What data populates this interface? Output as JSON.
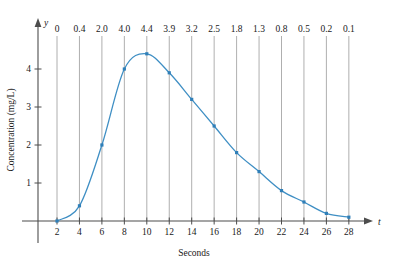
{
  "chart_data": {
    "type": "line",
    "title": "",
    "xlabel": "Seconds",
    "ylabel": "Concentration (mg/L)",
    "x_axis_name": "t",
    "y_axis_name": "y",
    "x": [
      2,
      4,
      6,
      8,
      10,
      12,
      14,
      16,
      18,
      20,
      22,
      24,
      26,
      28
    ],
    "values": [
      0,
      0.4,
      2.0,
      4.0,
      4.4,
      3.9,
      3.2,
      2.5,
      1.8,
      1.3,
      0.8,
      0.5,
      0.2,
      0.1
    ],
    "point_labels": [
      "0",
      "0.4",
      "2.0",
      "4.0",
      "4.4",
      "3.9",
      "3.2",
      "2.5",
      "1.8",
      "1.3",
      "0.8",
      "0.5",
      "0.2",
      "0.1"
    ],
    "xticks": [
      2,
      4,
      6,
      8,
      10,
      12,
      14,
      16,
      18,
      20,
      22,
      24,
      26,
      28
    ],
    "xtick_labels": [
      "2",
      "4",
      "6",
      "8",
      "10",
      "12",
      "14",
      "16",
      "18",
      "20",
      "22",
      "24",
      "26",
      "28"
    ],
    "yticks": [
      1,
      2,
      3,
      4
    ],
    "ytick_labels": [
      "1",
      "2",
      "3",
      "4"
    ],
    "xlim": [
      0,
      30
    ],
    "ylim": [
      0,
      5
    ],
    "grid": "vertical-droplines-at-each-point",
    "legend": "none",
    "curve_color": "#3f8fc4",
    "marker_color": "#2f7fb8",
    "marker_shape": "square",
    "grid_color": "#9a9a9a",
    "axis_color": "#4d4d4d"
  }
}
